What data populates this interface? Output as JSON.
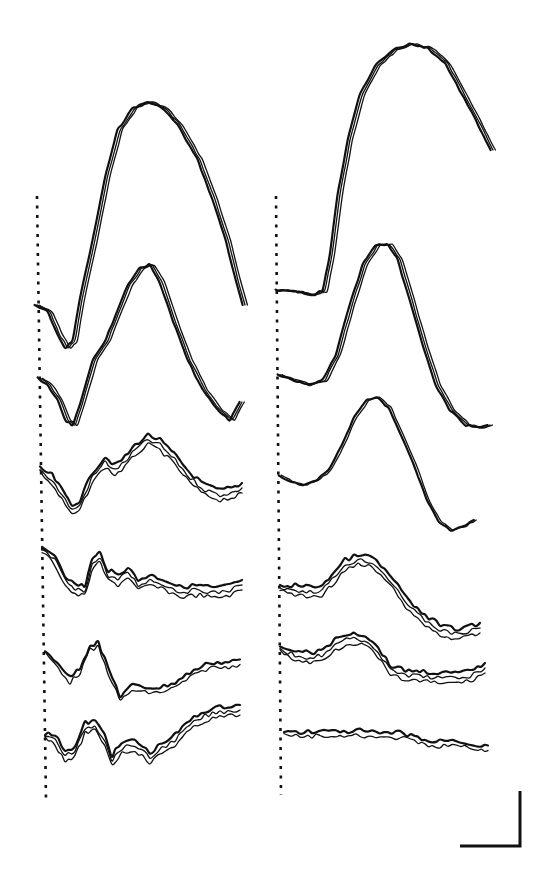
{
  "figure": {
    "ink_color": "#111111",
    "background": "#ffffff"
  },
  "chart_data": {
    "type": "line",
    "title": "",
    "xlabel": "",
    "ylabel": "",
    "grid": false,
    "legend": null,
    "annotations": [
      "stimulus onset dotted line (left panel)",
      "stimulus onset dotted line (right panel)",
      "L-shaped scale bar (bottom right, unlabeled)"
    ],
    "panels": [
      {
        "name": "left",
        "onset_x": 37,
        "traces": [
          {
            "name": "L1",
            "overlays": 3,
            "points": [
              [
                37,
                305
              ],
              [
                50,
                312
              ],
              [
                60,
                335
              ],
              [
                68,
                348
              ],
              [
                75,
                340
              ],
              [
                82,
                300
              ],
              [
                95,
                240
              ],
              [
                108,
                175
              ],
              [
                120,
                130
              ],
              [
                135,
                108
              ],
              [
                150,
                102
              ],
              [
                165,
                108
              ],
              [
                180,
                125
              ],
              [
                200,
                160
              ],
              [
                215,
                200
              ],
              [
                228,
                240
              ],
              [
                238,
                280
              ],
              [
                245,
                305
              ]
            ]
          },
          {
            "name": "L2",
            "overlays": 3,
            "points": [
              [
                40,
                378
              ],
              [
                50,
                385
              ],
              [
                60,
                400
              ],
              [
                68,
                420
              ],
              [
                75,
                425
              ],
              [
                82,
                405
              ],
              [
                95,
                360
              ],
              [
                108,
                340
              ],
              [
                118,
                315
              ],
              [
                130,
                285
              ],
              [
                142,
                268
              ],
              [
                152,
                265
              ],
              [
                162,
                282
              ],
              [
                175,
                320
              ],
              [
                190,
                360
              ],
              [
                205,
                390
              ],
              [
                220,
                410
              ],
              [
                232,
                420
              ],
              [
                242,
                402
              ]
            ]
          },
          {
            "name": "L3",
            "overlays": 3,
            "points": [
              [
                40,
                470
              ],
              [
                52,
                480
              ],
              [
                62,
                495
              ],
              [
                72,
                510
              ],
              [
                80,
                505
              ],
              [
                92,
                478
              ],
              [
                105,
                462
              ],
              [
                115,
                470
              ],
              [
                125,
                462
              ],
              [
                135,
                450
              ],
              [
                148,
                440
              ],
              [
                160,
                445
              ],
              [
                175,
                460
              ],
              [
                190,
                478
              ],
              [
                205,
                490
              ],
              [
                220,
                495
              ],
              [
                235,
                492
              ],
              [
                242,
                488
              ]
            ]
          },
          {
            "name": "L4",
            "overlays": 3,
            "points": [
              [
                42,
                550
              ],
              [
                55,
                560
              ],
              [
                65,
                580
              ],
              [
                75,
                590
              ],
              [
                85,
                590
              ],
              [
                92,
                565
              ],
              [
                100,
                558
              ],
              [
                108,
                575
              ],
              [
                118,
                580
              ],
              [
                128,
                572
              ],
              [
                138,
                585
              ],
              [
                150,
                580
              ],
              [
                165,
                585
              ],
              [
                180,
                592
              ],
              [
                200,
                590
              ],
              [
                215,
                593
              ],
              [
                230,
                590
              ],
              [
                242,
                585
              ]
            ]
          },
          {
            "name": "L5",
            "overlays": 2,
            "points": [
              [
                45,
                652
              ],
              [
                58,
                665
              ],
              [
                70,
                680
              ],
              [
                80,
                670
              ],
              [
                90,
                648
              ],
              [
                98,
                645
              ],
              [
                108,
                670
              ],
              [
                120,
                698
              ],
              [
                132,
                688
              ],
              [
                145,
                690
              ],
              [
                160,
                690
              ],
              [
                175,
                685
              ],
              [
                190,
                675
              ],
              [
                210,
                665
              ],
              [
                225,
                665
              ],
              [
                240,
                662
              ]
            ]
          },
          {
            "name": "L6",
            "overlays": 3,
            "points": [
              [
                45,
                735
              ],
              [
                55,
                740
              ],
              [
                65,
                755
              ],
              [
                75,
                752
              ],
              [
                85,
                728
              ],
              [
                95,
                726
              ],
              [
                105,
                740
              ],
              [
                112,
                760
              ],
              [
                122,
                748
              ],
              [
                135,
                745
              ],
              [
                150,
                758
              ],
              [
                162,
                748
              ],
              [
                175,
                740
              ],
              [
                190,
                725
              ],
              [
                205,
                716
              ],
              [
                220,
                712
              ],
              [
                240,
                710
              ]
            ]
          }
        ]
      },
      {
        "name": "right",
        "onset_x": 276,
        "traces": [
          {
            "name": "R1",
            "overlays": 3,
            "points": [
              [
                278,
                290
              ],
              [
                300,
                292
              ],
              [
                315,
                295
              ],
              [
                325,
                290
              ],
              [
                332,
                255
              ],
              [
                340,
                195
              ],
              [
                350,
                140
              ],
              [
                362,
                95
              ],
              [
                378,
                65
              ],
              [
                395,
                50
              ],
              [
                412,
                44
              ],
              [
                430,
                48
              ],
              [
                448,
                64
              ],
              [
                462,
                90
              ],
              [
                478,
                120
              ],
              [
                493,
                150
              ]
            ]
          },
          {
            "name": "R2",
            "overlays": 3,
            "points": [
              [
                280,
                375
              ],
              [
                295,
                380
              ],
              [
                310,
                385
              ],
              [
                325,
                380
              ],
              [
                338,
                355
              ],
              [
                352,
                305
              ],
              [
                365,
                265
              ],
              [
                378,
                245
              ],
              [
                390,
                245
              ],
              [
                400,
                260
              ],
              [
                412,
                300
              ],
              [
                425,
                345
              ],
              [
                438,
                385
              ],
              [
                452,
                410
              ],
              [
                468,
                425
              ],
              [
                482,
                428
              ],
              [
                490,
                425
              ]
            ]
          },
          {
            "name": "R3",
            "overlays": 2,
            "points": [
              [
                280,
                475
              ],
              [
                292,
                482
              ],
              [
                305,
                485
              ],
              [
                318,
                480
              ],
              [
                330,
                470
              ],
              [
                343,
                445
              ],
              [
                355,
                418
              ],
              [
                368,
                400
              ],
              [
                378,
                397
              ],
              [
                390,
                408
              ],
              [
                402,
                435
              ],
              [
                415,
                465
              ],
              [
                428,
                500
              ],
              [
                440,
                522
              ],
              [
                452,
                530
              ],
              [
                465,
                526
              ],
              [
                475,
                520
              ]
            ]
          },
          {
            "name": "R4",
            "overlays": 3,
            "points": [
              [
                280,
                588
              ],
              [
                295,
                590
              ],
              [
                310,
                592
              ],
              [
                322,
                590
              ],
              [
                332,
                580
              ],
              [
                345,
                565
              ],
              [
                358,
                560
              ],
              [
                372,
                562
              ],
              [
                385,
                575
              ],
              [
                398,
                590
              ],
              [
                410,
                608
              ],
              [
                425,
                620
              ],
              [
                440,
                630
              ],
              [
                455,
                634
              ],
              [
                468,
                632
              ],
              [
                480,
                628
              ]
            ]
          },
          {
            "name": "R5",
            "overlays": 3,
            "points": [
              [
                280,
                650
              ],
              [
                295,
                655
              ],
              [
                310,
                658
              ],
              [
                322,
                655
              ],
              [
                335,
                645
              ],
              [
                350,
                638
              ],
              [
                365,
                640
              ],
              [
                378,
                652
              ],
              [
                390,
                670
              ],
              [
                405,
                675
              ],
              [
                420,
                676
              ],
              [
                438,
                678
              ],
              [
                455,
                678
              ],
              [
                470,
                676
              ],
              [
                485,
                668
              ]
            ]
          },
          {
            "name": "R6",
            "overlays": 2,
            "points": [
              [
                284,
                732
              ],
              [
                300,
                735
              ],
              [
                320,
                733
              ],
              [
                340,
                735
              ],
              [
                360,
                733
              ],
              [
                380,
                736
              ],
              [
                400,
                735
              ],
              [
                418,
                740
              ],
              [
                432,
                745
              ],
              [
                448,
                742
              ],
              [
                465,
                745
              ],
              [
                478,
                748
              ],
              [
                488,
                748
              ]
            ]
          }
        ]
      }
    ],
    "scale_bar": {
      "horizontal_px": [
        460,
        520
      ],
      "vertical_px": [
        791,
        846
      ],
      "label": ""
    }
  }
}
